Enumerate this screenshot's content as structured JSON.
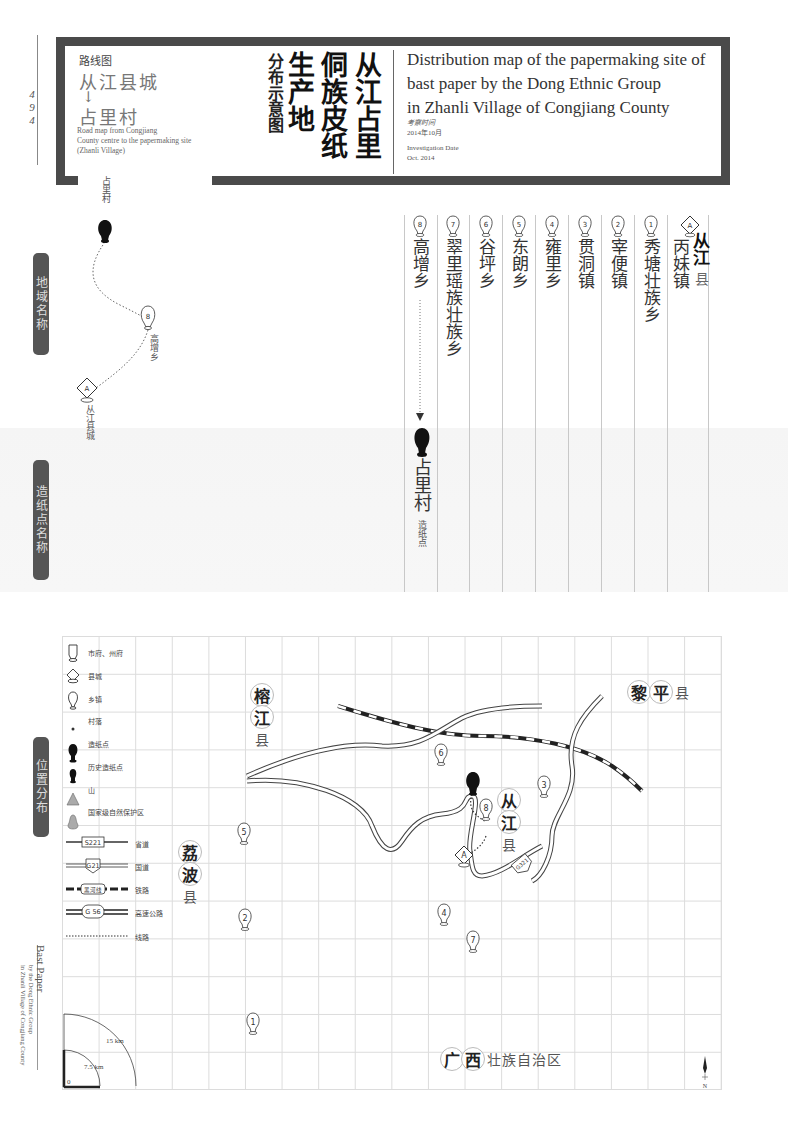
{
  "page": {
    "number_digits": [
      "4",
      "9",
      "4"
    ]
  },
  "header": {
    "route_label": "路线图",
    "route_from": "从江县城",
    "route_arrow": "↓",
    "route_to": "占里村",
    "route_en_lines": [
      "Road map from Congjiang",
      "County centre to the papermaking site",
      " (Zhanli Village)"
    ],
    "title_cn_columns": [
      "从江占里",
      "侗族皮纸",
      "生产地"
    ],
    "title_cn_sub": "分布示意图",
    "title_en_lines": [
      "Distribution map of the papermaking site of",
      "bast paper by the Dong Ethnic Group",
      "in Zhanli Village of Congjiang County"
    ],
    "date_cn_label": "考察时间",
    "date_cn": "2014年10月",
    "date_en_label": "Investigation Date",
    "date_en": "Oct. 2014"
  },
  "side_tabs": {
    "region_names": "地域名称",
    "site_names": "造纸点名称",
    "location": "位置分布"
  },
  "route_map": {
    "start": "占里村",
    "waypoint_num": "8",
    "waypoint_label": "高增乡",
    "end_marker": "A",
    "end_label": "从江县城"
  },
  "region_columns": [
    {
      "marker": "A",
      "type": "county",
      "county_bold": "从江",
      "county_suffix": "县",
      "name": "丙妹镇"
    },
    {
      "marker": "1",
      "type": "township",
      "name": "秀塘壮族乡"
    },
    {
      "marker": "2",
      "type": "township",
      "name": "宰便镇"
    },
    {
      "marker": "3",
      "type": "township",
      "name": "贯洞镇"
    },
    {
      "marker": "4",
      "type": "township",
      "name": "雍里乡"
    },
    {
      "marker": "5",
      "type": "township",
      "name": "东朗乡"
    },
    {
      "marker": "6",
      "type": "township",
      "name": "谷坪乡"
    },
    {
      "marker": "7",
      "type": "township",
      "name": "翠里瑶族壮族乡"
    },
    {
      "marker": "8",
      "type": "township",
      "name": "高增乡"
    }
  ],
  "site": {
    "name": "占里村",
    "type_label": "造纸点"
  },
  "legend": {
    "items": [
      {
        "icon": "prefecture-icon",
        "label": "市府、州府"
      },
      {
        "icon": "county-icon",
        "label": "县城"
      },
      {
        "icon": "township-icon",
        "label": "乡镇"
      },
      {
        "icon": "village-dot-icon",
        "label": "村落"
      },
      {
        "icon": "papermaking-site-icon",
        "label": "造纸点"
      },
      {
        "icon": "historic-site-icon",
        "label": "历史造纸点"
      },
      {
        "icon": "mountain-icon",
        "label": "山"
      },
      {
        "icon": "nature-reserve-icon",
        "label": "国家级自然保护区"
      }
    ],
    "roads": [
      {
        "badge": "S221",
        "label": "省道"
      },
      {
        "badge": "G21",
        "label": "国道"
      },
      {
        "badge": "黑河线",
        "label": "铁路"
      },
      {
        "badge": "G 56",
        "label": "高速公路"
      },
      {
        "badge": "",
        "label": "线路"
      }
    ]
  },
  "map": {
    "counties": [
      {
        "id": "rongjiang",
        "bold": [
          "榕",
          "江"
        ],
        "suffix": "县"
      },
      {
        "id": "libo",
        "bold": [
          "荔",
          "波"
        ],
        "suffix": "县"
      },
      {
        "id": "liping",
        "bold": [
          "黎",
          "平"
        ],
        "suffix": "县"
      },
      {
        "id": "congjiang",
        "bold": [
          "从",
          "江"
        ],
        "suffix": "县"
      },
      {
        "id": "guangxi",
        "bold": [
          "广",
          "西"
        ],
        "suffix": "壮族自治区"
      }
    ],
    "markers": [
      "1",
      "2",
      "3",
      "4",
      "5",
      "6",
      "7",
      "8",
      "A"
    ],
    "road_badge": "G321",
    "north": "N",
    "scale": {
      "zero": "0",
      "small": "7.5 km",
      "large": "15 km"
    }
  },
  "footer_side": {
    "title": "Bast Paper",
    "line1": "by the Dong Ethnic Group",
    "line2": "in Zhanli Village of Congjiang County"
  }
}
